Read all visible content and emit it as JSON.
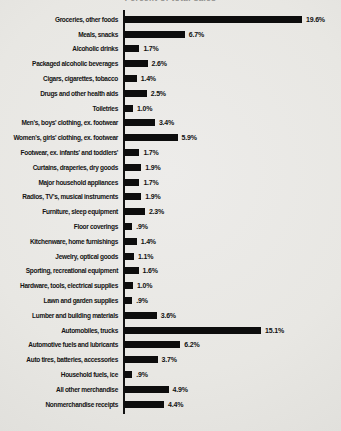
{
  "chart_data": {
    "type": "bar",
    "orientation": "horizontal",
    "title": "Percent of total sales",
    "categories": [
      "Groceries, other foods",
      "Meals, snacks",
      "Alcoholic drinks",
      "Packaged alcoholic beverages",
      "Cigars, cigarettes, tobacco",
      "Drugs and other health aids",
      "Toiletries",
      "Men's, boys' clothing, ex. footwear",
      "Women's, girls' clothing, ex. footwear",
      "Footwear, ex. infants' and toddlers'",
      "Curtains, draperies, dry goods",
      "Major household appliances",
      "Radios, TV's, musical instruments",
      "Furniture, sleep equipment",
      "Floor coverings",
      "Kitchenware, home furnishings",
      "Jewelry, optical goods",
      "Sporting, recreational equipment",
      "Hardware, tools, electrical supplies",
      "Lawn and garden supplies",
      "Lumber and building materials",
      "Automobiles, trucks",
      "Automotive fuels and lubricants",
      "Auto tires, batteries, accessories",
      "Household fuels, ice",
      "All other merchandise",
      "Nonmerchandise receipts"
    ],
    "values": [
      19.6,
      6.7,
      1.7,
      2.6,
      1.4,
      2.5,
      1.0,
      3.4,
      5.9,
      1.7,
      1.9,
      1.7,
      1.9,
      2.3,
      0.9,
      1.4,
      1.1,
      1.6,
      1.0,
      0.9,
      3.6,
      15.1,
      6.2,
      3.7,
      0.9,
      4.9,
      4.4
    ],
    "value_labels": [
      "19.6%",
      "6.7%",
      "1.7%",
      "2.6%",
      "1.4%",
      "2.5%",
      "1.0%",
      "3.4%",
      "5.9%",
      "1.7%",
      "1.9%",
      "1.7%",
      "1.9%",
      "2.3%",
      ".9%",
      "1.4%",
      "1.1%",
      "1.6%",
      "1.0%",
      ".9%",
      "3.6%",
      "15.1%",
      "6.2%",
      "3.7%",
      ".9%",
      "4.9%",
      "4.4%"
    ],
    "xlim": [
      0,
      21
    ],
    "grid": false,
    "legend": "none",
    "bar_color": "#0d0d0d",
    "axis_color": "#111111",
    "background_color": "#e8e7e3"
  }
}
